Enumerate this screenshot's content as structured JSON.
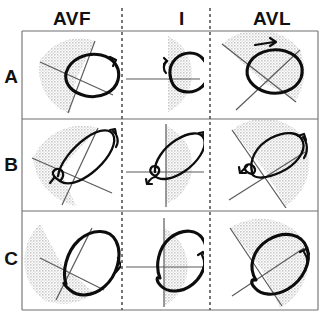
{
  "figure": {
    "kind": "3x3 grid of ECG lead loop diagrams",
    "background_color": "#ffffff",
    "frame_color": "#6e6e6e",
    "loop_color": "#0d0d0d",
    "sector_fill_color": "#d9d9d9",
    "axis_color": "#5a5a5a",
    "divider_style": "vertical dashed lines between columns"
  },
  "columns": [
    {
      "id": "avf",
      "label": "AVF",
      "center_x": 72
    },
    {
      "id": "i",
      "label": "I",
      "center_x": 182
    },
    {
      "id": "avl",
      "label": "AVL",
      "center_x": 272
    }
  ],
  "rows": [
    {
      "id": "a",
      "label": "A",
      "center_y": 76
    },
    {
      "id": "b",
      "label": "B",
      "center_y": 164
    },
    {
      "id": "c",
      "label": "C",
      "center_y": 258
    }
  ],
  "cells": [
    {
      "row": "A",
      "column": "AVF",
      "sector_orientation": "upper-left fan, opening toward upper right",
      "loop_shape": "broad oval tilted about -25 degrees",
      "rotation_arrow": "clockwise, arrowhead at upper right of loop",
      "axis_lines": 2
    },
    {
      "row": "A",
      "column": "I",
      "sector_orientation": "right half-disc",
      "loop_shape": "rounded oval, nearly horizontal",
      "rotation_arrow": "counter-clockwise, small arrow at left of loop",
      "axis_lines": 1
    },
    {
      "row": "A",
      "column": "AVL",
      "sector_orientation": "upper fan tilted left",
      "loop_shape": "oval tilted about -20 degrees",
      "rotation_arrow": "clockwise, arrowhead on top of loop",
      "axis_lines": 2
    },
    {
      "row": "B",
      "column": "AVF",
      "sector_orientation": "left fan, opening toward upper right",
      "loop_shape": "narrow elongated loop tilted about -40 degrees with small basal knot",
      "rotation_arrow": "clockwise, arrowhead at upper right tip",
      "axis_lines": 2
    },
    {
      "row": "B",
      "column": "I",
      "sector_orientation": "right half-disc",
      "loop_shape": "narrow elongated loop tilted about -35 degrees with small basal knot",
      "rotation_arrow": "clockwise at upper right, small counter arrow at basal knot",
      "axis_lines": 2
    },
    {
      "row": "B",
      "column": "AVL",
      "sector_orientation": "fan opening upper-left to lower-right",
      "loop_shape": "narrow elongated loop tilted about -25 degrees with basal knot",
      "rotation_arrow": "clockwise, arrowhead at right tip, small arrow at basal knot",
      "axis_lines": 2
    },
    {
      "row": "C",
      "column": "AVF",
      "sector_orientation": "left half fan",
      "loop_shape": "large teardrop / pear shaped loop, long axis up-right",
      "rotation_arrow": "clockwise, arrowhead at right margin",
      "axis_lines": 2
    },
    {
      "row": "C",
      "column": "I",
      "sector_orientation": "right half-disc",
      "loop_shape": "large teardrop loop, long axis up-right",
      "rotation_arrow": "clockwise, arrowhead at right margin",
      "axis_lines": 2
    },
    {
      "row": "C",
      "column": "AVL",
      "sector_orientation": "wide fan opening to lower left",
      "loop_shape": "large teardrop loop tilted about -35 degrees",
      "rotation_arrow": "clockwise, arrowhead at right margin",
      "axis_lines": 2
    }
  ]
}
